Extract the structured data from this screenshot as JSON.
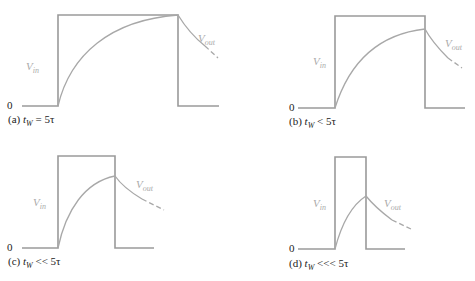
{
  "panels": [
    {
      "id": "a",
      "caption_prefix": "(a) ",
      "tw": "t",
      "sub": "W",
      "relation": " = 5τ",
      "vin": "V",
      "vin_sub": "in",
      "vout": "V",
      "vout_sub": "out",
      "zero": "0"
    },
    {
      "id": "b",
      "caption_prefix": "(b) ",
      "tw": "t",
      "sub": "W",
      "relation": " < 5τ",
      "vin": "V",
      "vin_sub": "in",
      "vout": "V",
      "vout_sub": "out",
      "zero": "0"
    },
    {
      "id": "c",
      "caption_prefix": "(c) ",
      "tw": "t",
      "sub": "W",
      "relation": " << 5τ",
      "vin": "V",
      "vin_sub": "in",
      "vout": "V",
      "vout_sub": "out",
      "zero": "0"
    },
    {
      "id": "d",
      "caption_prefix": "(d) ",
      "tw": "t",
      "sub": "W",
      "relation": " <<< 5τ",
      "vin": "V",
      "vin_sub": "in",
      "vout": "V",
      "vout_sub": "out",
      "zero": "0"
    }
  ],
  "colors": {
    "wave": "#9a9a9a",
    "label": "#222222",
    "signal_label": "#aaaaaa"
  }
}
